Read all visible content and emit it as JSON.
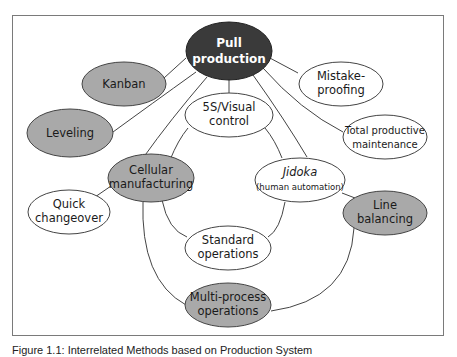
{
  "diagram": {
    "colors": {
      "dark_fill": "#3a3a3a",
      "gray_fill": "#a9a9a9",
      "white_fill": "#ffffff",
      "stroke": "#444444",
      "frame": "#7a7a7a"
    },
    "nodes": {
      "pull_production": {
        "line1": "Pull",
        "line2": "production",
        "fill": "dark"
      },
      "kanban": {
        "line1": "Kanban",
        "fill": "gray"
      },
      "mistake_proofing": {
        "line1": "Mistake-",
        "line2": "proofing",
        "fill": "white"
      },
      "leveling": {
        "line1": "Leveling",
        "fill": "gray"
      },
      "visual_control": {
        "line1": "5S/Visual",
        "line2": "control",
        "fill": "white"
      },
      "tpm": {
        "line1": "Total productive",
        "line2": "maintenance",
        "fill": "white"
      },
      "cellular": {
        "line1": "Cellular",
        "line2": "manufacturing",
        "fill": "gray"
      },
      "jidoka": {
        "line1": "Jidoka",
        "line2": "(human automation)",
        "fill": "white"
      },
      "quick_changeover": {
        "line1": "Quick",
        "line2": "changeover",
        "fill": "white"
      },
      "line_balancing": {
        "line1": "Line",
        "line2": "balancing",
        "fill": "gray"
      },
      "standard_operations": {
        "line1": "Standard",
        "line2": "operations",
        "fill": "white"
      },
      "multi_process": {
        "line1": "Multi-process",
        "line2": "operations",
        "fill": "gray"
      }
    },
    "edges": [
      [
        "pull_production",
        "kanban"
      ],
      [
        "pull_production",
        "leveling"
      ],
      [
        "pull_production",
        "cellular"
      ],
      [
        "pull_production",
        "visual_control"
      ],
      [
        "pull_production",
        "jidoka"
      ],
      [
        "pull_production",
        "mistake_proofing"
      ],
      [
        "pull_production",
        "tpm"
      ],
      [
        "visual_control",
        "cellular"
      ],
      [
        "visual_control",
        "jidoka"
      ],
      [
        "cellular",
        "quick_changeover"
      ],
      [
        "cellular",
        "standard_operations"
      ],
      [
        "cellular",
        "multi_process"
      ],
      [
        "jidoka",
        "standard_operations"
      ],
      [
        "jidoka",
        "line_balancing"
      ],
      [
        "line_balancing",
        "multi_process"
      ]
    ]
  },
  "caption": "Figure 1.1: Interrelated Methods based on Production System"
}
